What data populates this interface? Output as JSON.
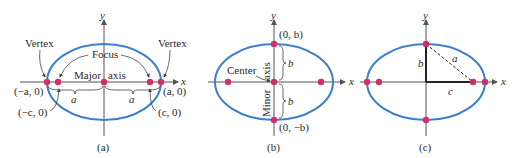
{
  "colors": {
    "ellipse": "#3a7fd0",
    "point": "#d0306a",
    "axis": "#555555",
    "text": "#2a2a2a"
  },
  "panels": [
    {
      "id": "a",
      "caption": "(a)",
      "axis_y": "y",
      "axis_x": "x",
      "labels": {
        "vertex_left": "Vertex",
        "vertex_right": "Vertex",
        "focus": "Focus",
        "major": "Major",
        "axis": "axis",
        "neg_a": "(−a, 0)",
        "pos_a": "(a, 0)",
        "neg_c": "(−c, 0)",
        "pos_c": "(c, 0)",
        "a_left": "a",
        "a_right": "a"
      }
    },
    {
      "id": "b",
      "caption": "(b)",
      "axis_y": "y",
      "axis_x": "x",
      "labels": {
        "top": "(0, b)",
        "bottom": "(0, −b)",
        "center": "Center",
        "minor": "Minor",
        "axis": "axis",
        "b_top": "b",
        "b_bottom": "b"
      }
    },
    {
      "id": "c",
      "caption": "(c)",
      "axis_y": "y",
      "axis_x": "x",
      "labels": {
        "a": "a",
        "b": "b",
        "c": "c"
      }
    }
  ]
}
